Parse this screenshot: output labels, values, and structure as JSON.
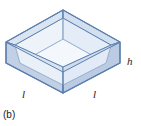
{
  "figure": {
    "caption": "(b)",
    "shape_name": "open-top rectangular box",
    "projection": "isometric",
    "labels": {
      "length_left": "l",
      "length_right": "l",
      "height": "h"
    },
    "colors": {
      "outline": "#5b7fae",
      "outer_face_left": "#c2d0e6",
      "outer_face_right": "#bccbe4",
      "rim_top": "#d5e0ef",
      "inner_wall_left": "#eef3fa",
      "inner_wall_right": "#e4ecf7",
      "inner_bottom": "#f4f8fc",
      "text": "#1a1a1a",
      "background": "#ffffff"
    },
    "geometry": {
      "outer_top_back": [
        63,
        10
      ],
      "outer_top_left": [
        6,
        42
      ],
      "outer_top_right": [
        120,
        42
      ],
      "outer_top_front": [
        63,
        72
      ],
      "outer_bottom_left": [
        6,
        63
      ],
      "outer_bottom_right": [
        120,
        63
      ],
      "outer_bottom_front": [
        63,
        93
      ],
      "inner_top_back": [
        63,
        18
      ],
      "inner_top_left": [
        15,
        45
      ],
      "inner_top_right": [
        111,
        45
      ],
      "inner_top_front": [
        63,
        67
      ],
      "inner_floor_back": [
        63,
        39
      ],
      "inner_floor_left": [
        20,
        63
      ],
      "inner_floor_right": [
        106,
        63
      ],
      "inner_floor_front": [
        63,
        85
      ]
    }
  }
}
